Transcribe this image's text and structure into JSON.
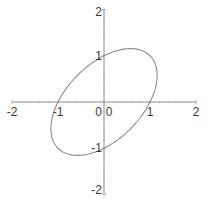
{
  "chart_data": {
    "type": "line",
    "title": "",
    "xlabel": "",
    "ylabel": "",
    "xlim": [
      -2,
      2
    ],
    "ylim": [
      -2,
      2
    ],
    "grid": false,
    "legend": null,
    "x_ticks": [
      -2,
      -1,
      0,
      1,
      2
    ],
    "y_ticks": [
      -2,
      -1,
      0,
      1,
      2
    ],
    "x_tick_labels": [
      "-2",
      "-1",
      "0",
      "1",
      "2"
    ],
    "y_tick_labels": [
      "-2",
      "-1",
      "0",
      "1",
      "2"
    ],
    "series": [
      {
        "name": "implicit curve x^2 - x*y + y^2 = 1",
        "equation": "x^2 - x*y + y^2 = 1",
        "color": "#8c8c8c",
        "key_points": [
          [
            1,
            0
          ],
          [
            -1,
            0
          ],
          [
            0,
            1
          ],
          [
            0,
            -1
          ],
          [
            0.577,
            1.155
          ],
          [
            -0.577,
            -1.155
          ],
          [
            1.155,
            0.577
          ],
          [
            -1.155,
            -0.577
          ]
        ]
      }
    ]
  },
  "colors": {
    "axis": "#8a8a8a",
    "curve": "#8c8c8c",
    "label": "#3a3a3a"
  }
}
